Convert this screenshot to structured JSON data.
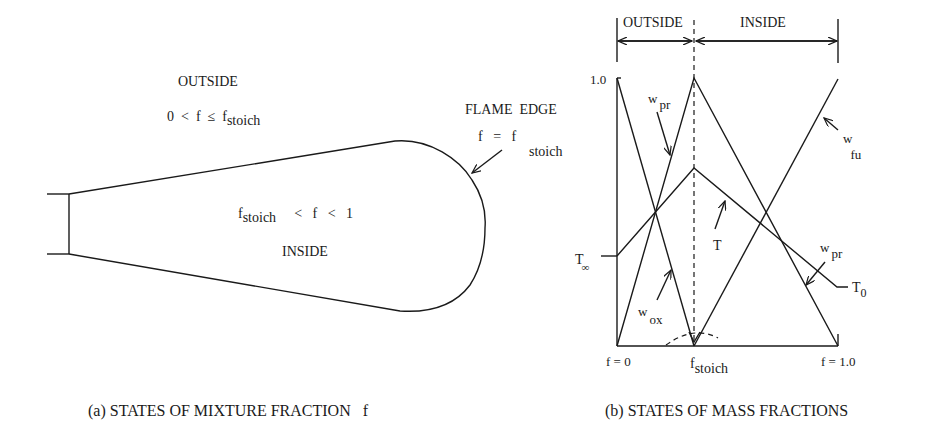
{
  "panel_a": {
    "caption": "(a) STATES OF MIXTURE FRACTION   f",
    "outside_label": "OUTSIDE",
    "outside_condition": {
      "lhs": "0  <  f  ≤  f",
      "sub": "stoich"
    },
    "inside_condition": {
      "f": "f",
      "sub": "stoich",
      "rhs": "<   f   <   1"
    },
    "inside_label": "INSIDE",
    "flame_edge_label": "FLAME  EDGE",
    "flame_edge_condition": {
      "lhs": "f   =   f",
      "sub": "stoich"
    }
  },
  "panel_b": {
    "caption": "(b) STATES OF MASS FRACTIONS",
    "region_outside": "OUTSIDE",
    "region_inside": "INSIDE",
    "y_tick_top": "1.0",
    "t_inf": {
      "base": "T",
      "sub": "∞"
    },
    "t_0": {
      "base": "T",
      "sub": "0"
    },
    "x_ticks": {
      "left": "f = 0",
      "mid": {
        "base": "f",
        "sub": "stoich"
      },
      "right": "f = 1.0"
    },
    "curves": {
      "w_pr_left": {
        "base": "w",
        "sub": "pr"
      },
      "w_pr_right": {
        "base": "w",
        "sub": "pr"
      },
      "w_ox": {
        "base": "w",
        "sub": "ox"
      },
      "w_fu": {
        "base": "w",
        "sub": "fu"
      },
      "T": "T"
    }
  }
}
